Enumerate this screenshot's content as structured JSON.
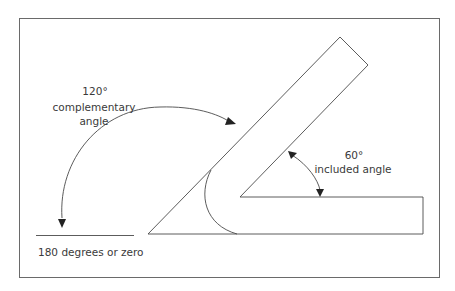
{
  "diagram": {
    "type": "angle-measurement-illustration",
    "labels": {
      "complementary_value": "120°",
      "complementary_line1": "complementary",
      "complementary_line2": "angle",
      "included_value": "60°",
      "included_text": "included angle",
      "baseline": "180 degrees or zero"
    },
    "colors": {
      "line": "#4a4a4a",
      "text": "#3a3a3a",
      "border": "#6a6a6a",
      "background": "#ffffff"
    }
  }
}
